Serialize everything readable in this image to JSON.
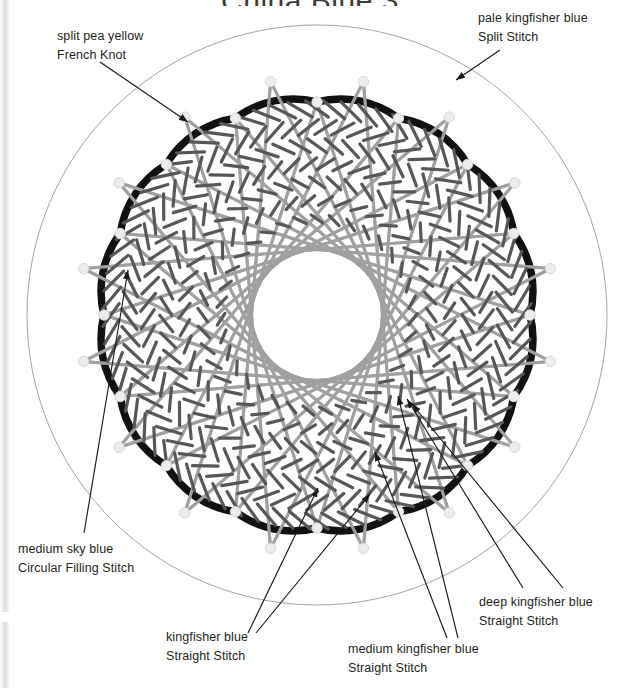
{
  "title": "China Blue  3",
  "page": {
    "width": 620,
    "height": 688,
    "background": "#ffffff"
  },
  "colors": {
    "outline_black": "#111111",
    "guide_circle": "#999999",
    "chord_gray": "#a0a0a0",
    "stitch_dark": "#575757",
    "french_knot": "#ededed",
    "french_knot_stroke": "#d8d8d8",
    "label_text": "#231f20",
    "leader_line": "#1a1a1a"
  },
  "geometry": {
    "center_x": 317,
    "center_y": 315,
    "guide_circle_radius": 290,
    "scallop_count": 16,
    "scallop_cusp_radius": 213,
    "scallop_lobe_radius": 247,
    "knot_count": 32,
    "chord_ring_points": 32,
    "chord_skip": 13,
    "inner_hole_radius": 78,
    "stitch_rings": 7,
    "stitch_inner_radius": 96,
    "stitch_outer_radius": 206
  },
  "labels": [
    {
      "id": "label-split-pea-yellow",
      "name": "label-split-pea-yellow-french-knot",
      "line1": "split pea yellow",
      "line2": "French Knot",
      "leader": {
        "x1": 100,
        "y1": 62,
        "x2": 188,
        "y2": 122
      }
    },
    {
      "id": "label-pale-kingfisher",
      "name": "label-pale-kingfisher-blue-split-stitch",
      "line1": "pale kingfisher blue",
      "line2": "Split Stitch",
      "leader": {
        "x1": 500,
        "y1": 50,
        "x2": 456,
        "y2": 80
      }
    },
    {
      "id": "label-medium-sky-blue",
      "name": "label-medium-sky-blue-circular-filling-stitch",
      "line1": "medium sky blue",
      "line2": "Circular Filling Stitch",
      "leader": {
        "x1": 84,
        "y1": 533,
        "x2": 128,
        "y2": 270
      }
    },
    {
      "id": "label-kingfisher-blue",
      "name": "label-kingfisher-blue-straight-stitch",
      "line1": "kingfisher blue",
      "line2": "Straight Stitch",
      "leader": {
        "x1": 248,
        "y1": 633,
        "x2": 318,
        "y2": 488
      },
      "leader2": {
        "x1": 256,
        "y1": 633,
        "x2": 370,
        "y2": 494
      }
    },
    {
      "id": "label-medium-kingfisher",
      "name": "label-medium-kingfisher-blue-straight-stitch",
      "line1": "medium kingfisher blue",
      "line2": "Straight Stitch",
      "leader": {
        "x1": 447,
        "y1": 638,
        "x2": 375,
        "y2": 452
      },
      "leader2": {
        "x1": 458,
        "y1": 638,
        "x2": 398,
        "y2": 396
      }
    },
    {
      "id": "label-deep-kingfisher",
      "name": "label-deep-kingfisher-blue-straight-stitch",
      "line1": "deep kingfisher blue",
      "line2": "Straight Stitch",
      "leader": {
        "x1": 523,
        "y1": 588,
        "x2": 407,
        "y2": 399
      },
      "leader2": {
        "x1": 563,
        "y1": 588,
        "x2": 412,
        "y2": 404
      }
    }
  ],
  "stitch_legend": [
    {
      "thread": "split pea yellow",
      "stitch": "French Knot"
    },
    {
      "thread": "pale kingfisher blue",
      "stitch": "Split Stitch"
    },
    {
      "thread": "medium sky blue",
      "stitch": "Circular Filling Stitch"
    },
    {
      "thread": "kingfisher blue",
      "stitch": "Straight Stitch"
    },
    {
      "thread": "medium kingfisher blue",
      "stitch": "Straight Stitch"
    },
    {
      "thread": "deep kingfisher blue",
      "stitch": "Straight Stitch"
    }
  ]
}
